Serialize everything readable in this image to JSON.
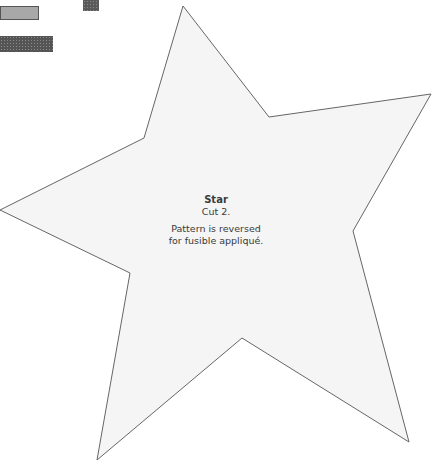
{
  "swatches": [
    {
      "name": "gray-swatch",
      "color": "#a8a8a8"
    },
    {
      "name": "dark-small-swatch",
      "color": "#5a5a5a"
    },
    {
      "name": "dark-wide-swatch",
      "color": "#555555"
    }
  ],
  "star": {
    "fill": "#f5f5f5",
    "stroke": "#666666",
    "points": "183,6 269,117 431,94 353,231 409,442 242,338 97,460 130,273 0,210 144,138"
  },
  "label": {
    "title": "Star",
    "cut": "Cut 2.",
    "note_line1": "Pattern is reversed",
    "note_line2": "for fusible appliqué."
  }
}
